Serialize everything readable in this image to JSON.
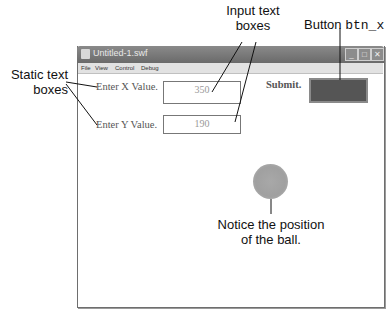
{
  "callouts": {
    "input_boxes_line1": "Input text",
    "input_boxes_line2": "boxes",
    "button_prefix": "Button ",
    "button_name": "btn_x",
    "static_line1": "Static text",
    "static_line2": "boxes",
    "ball_line1": "Notice the position",
    "ball_line2": "of the ball."
  },
  "window": {
    "title": "Untitled-1.swf",
    "controls": {
      "minimize": "_",
      "maximize": "□",
      "close": "✕"
    },
    "menu": [
      "File",
      "View",
      "Control",
      "Debug"
    ]
  },
  "stage": {
    "label_x": "Enter X Value.",
    "label_y": "Enter Y Value.",
    "input_x_value": "350",
    "input_y_value": "190",
    "submit_label": "Submit.",
    "button_color": "#555555",
    "ball_color": "#a4a4a4"
  }
}
